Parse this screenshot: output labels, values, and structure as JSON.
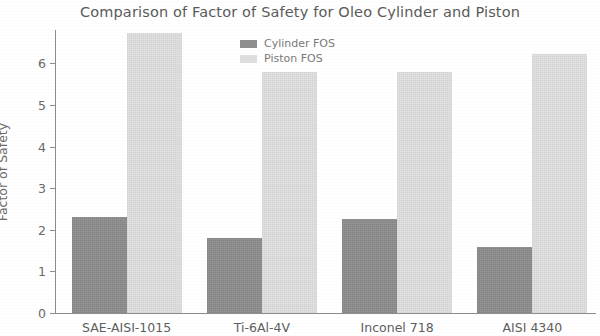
{
  "chart_data": {
    "type": "bar",
    "title": "Comparison of Factor of Safety for Oleo Cylinder and Piston",
    "xlabel": "",
    "ylabel": "Factor of Safety",
    "categories": [
      "SAE-AISI-1015",
      "Ti-6Al-4V",
      "Inconel 718",
      "AISI 4340"
    ],
    "series": [
      {
        "name": "Cylinder FOS",
        "values": [
          2.3,
          1.8,
          2.25,
          1.58
        ],
        "color": "#8e8e8e"
      },
      {
        "name": "Piston FOS",
        "values": [
          6.74,
          5.8,
          5.8,
          6.22
        ],
        "color": "#e2e2e2"
      }
    ],
    "ylim": [
      0,
      6.8
    ],
    "yticks": [
      0,
      1,
      2,
      3,
      4,
      5,
      6
    ],
    "ytick_labels": [
      "0",
      "1",
      "2",
      "3",
      "4",
      "5",
      "6"
    ],
    "grid": false,
    "legend_position": "upper-center-inside"
  },
  "legend": {
    "items": [
      {
        "label": "Cylinder FOS"
      },
      {
        "label": "Piston FOS"
      }
    ]
  },
  "axes": {
    "y_title": "Factor of Safety"
  }
}
